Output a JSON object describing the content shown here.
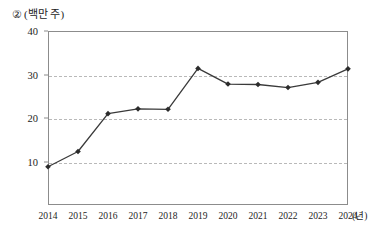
{
  "figure": {
    "number_marker": "②",
    "unit_label": "(백만 주)",
    "x_axis_unit": "(년)"
  },
  "chart_data": {
    "type": "line",
    "title": "",
    "subtitle": "",
    "xlabel": "(년)",
    "ylabel": "(백만 주)",
    "categories": [
      "2014",
      "2015",
      "2016",
      "2017",
      "2018",
      "2019",
      "2020",
      "2021",
      "2022",
      "2023",
      "2024"
    ],
    "values": [
      8.8,
      12.3,
      21.0,
      22.1,
      22.0,
      31.4,
      27.8,
      27.7,
      27.0,
      28.2,
      31.3
    ],
    "series": [
      {
        "name": "거래량",
        "values": [
          8.8,
          12.3,
          21.0,
          22.1,
          22.0,
          31.4,
          27.8,
          27.7,
          27.0,
          28.2,
          31.3
        ]
      }
    ],
    "ylim": [
      0,
      40
    ],
    "xlim": [
      "2014",
      "2024"
    ],
    "yticks": [
      10,
      20,
      30,
      40
    ],
    "ytick_labels": [
      "10",
      "20",
      "30",
      "40"
    ],
    "xtick_labels": [
      "2014",
      "2015",
      "2016",
      "2017",
      "2018",
      "2019",
      "2020",
      "2021",
      "2022",
      "2023",
      "2024"
    ],
    "grid": true,
    "grid_axis": "y",
    "grid_style": "dashed",
    "legend": false,
    "legend_position": "none",
    "marker": "diamond",
    "line_color": "#3a3a3a",
    "marker_color": "#2b2b2b",
    "grid_color": "#b9b9b9",
    "frame_color": "#8c8c8c",
    "background_color": "#ffffff",
    "annotations": []
  }
}
